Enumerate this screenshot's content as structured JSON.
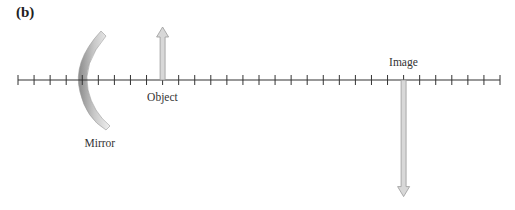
{
  "panel_label": "(b)",
  "labels": {
    "object": "Object",
    "image": "Image",
    "mirror": "Mirror"
  },
  "axis": {
    "tick_count": 31,
    "object_tick_index": 9,
    "image_tick_index": 24,
    "mirror_vertex_tick_index": 4
  },
  "object_arrow": {
    "direction": "up",
    "relative_height": 1.0
  },
  "image_arrow": {
    "direction": "down",
    "relative_height": 2.2
  },
  "colors": {
    "axis": "#333333",
    "arrow_fill": "#d8d8d8",
    "arrow_stroke": "#9a9a9a",
    "mirror_dark": "#8a8a8a",
    "mirror_light": "#f0f0f0",
    "text": "#333333"
  }
}
